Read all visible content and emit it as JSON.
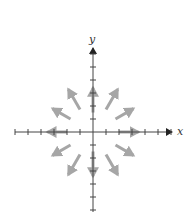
{
  "diagram": {
    "type": "vector-field",
    "axes": {
      "x_label": "x",
      "y_label": "y",
      "origin_px": [
        93,
        132
      ],
      "tick_spacing_px": 13,
      "x_ticks": [
        -6,
        -5,
        -4,
        -3,
        -2,
        -1,
        1,
        2,
        3,
        4,
        5,
        6
      ],
      "y_ticks": [
        -6,
        -5,
        -4,
        -3,
        -2,
        -1,
        1,
        2,
        3,
        4,
        5,
        6
      ]
    },
    "colors": {
      "axis": "#444444",
      "arrow": "#a6a6a6",
      "label": "#333333",
      "background": "#ffffff"
    },
    "arrows": [
      {
        "angle_deg": 0,
        "from_r": 2.0,
        "to_r": 3.5
      },
      {
        "angle_deg": 30,
        "from_r": 2.0,
        "to_r": 3.6
      },
      {
        "angle_deg": 60,
        "from_r": 2.0,
        "to_r": 3.8
      },
      {
        "angle_deg": 90,
        "from_r": 1.5,
        "to_r": 3.4
      },
      {
        "angle_deg": 120,
        "from_r": 2.0,
        "to_r": 3.8
      },
      {
        "angle_deg": 150,
        "from_r": 2.0,
        "to_r": 3.6
      },
      {
        "angle_deg": 180,
        "from_r": 2.0,
        "to_r": 3.5
      },
      {
        "angle_deg": 210,
        "from_r": 2.0,
        "to_r": 3.6
      },
      {
        "angle_deg": 240,
        "from_r": 2.0,
        "to_r": 3.8
      },
      {
        "angle_deg": 270,
        "from_r": 1.5,
        "to_r": 3.4
      },
      {
        "angle_deg": 300,
        "from_r": 2.0,
        "to_r": 3.8
      },
      {
        "angle_deg": 330,
        "from_r": 2.0,
        "to_r": 3.6
      }
    ]
  }
}
